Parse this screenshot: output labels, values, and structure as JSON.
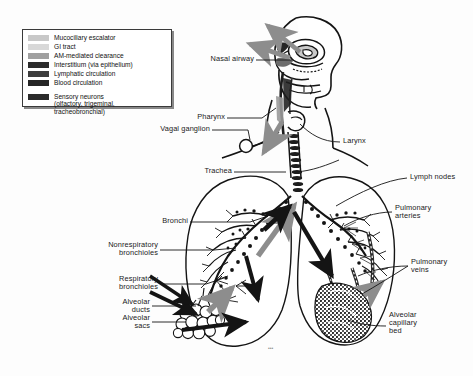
{
  "figure": {
    "signature": "artist signature",
    "background": "#fdfdfd"
  },
  "legend": {
    "box_name": "legend-box",
    "items": [
      {
        "label": "Mucociliary escalator",
        "color": "#c8c8c8"
      },
      {
        "label": "GI tract",
        "color": "#d8d8d8"
      },
      {
        "label": "AM-mediated clearance",
        "color": "#a0a0a0"
      },
      {
        "label": "Interstitium (via epithelium)",
        "color": "#2b2b2b"
      },
      {
        "label": "Lymphatic circulation",
        "color": "#3d3d3d"
      },
      {
        "label": "Blood circulation",
        "color": "#262626"
      }
    ],
    "extra": {
      "color": "#2b2b2b",
      "line1": "Sensory neurons",
      "line2": "(olfactory, trigeminal,",
      "line3": "tracheobronchial)"
    }
  },
  "labels": {
    "nasal_airway": "Nasal airway",
    "pharynx": "Pharynx",
    "vagal_ganglion": "Vagal ganglion",
    "larynx": "Larynx",
    "trachea": "Trachea",
    "lymph_nodes": "Lymph nodes",
    "bronchi": "Bronchi",
    "pulmonary_arteries_1": "Pulmonary",
    "pulmonary_arteries_2": "arteries",
    "nonresp_bronchioles_1": "Nonrespiratory",
    "nonresp_bronchioles_2": "bronchioles",
    "resp_bronchioles_1": "Respiratory",
    "resp_bronchioles_2": "bronchioles",
    "pulmonary_veins_1": "Pulmonary",
    "pulmonary_veins_2": "veins",
    "alveolar_ducts_1": "Alveolar",
    "alveolar_ducts_2": "ducts",
    "alveolar_sacs_1": "Alveolar",
    "alveolar_sacs_2": "sacs",
    "alveolar_cap_bed_1": "Alveolar",
    "alveolar_cap_bed_2": "capillary",
    "alveolar_cap_bed_3": "bed"
  },
  "colors": {
    "ink": "#141414",
    "gray_arrow": "#8d8d8d",
    "mid_gray": "#b4b4b4",
    "dark": "#1f1f1f"
  }
}
